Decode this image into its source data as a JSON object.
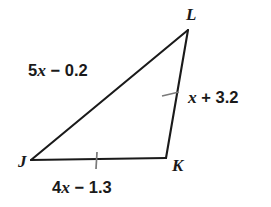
{
  "figure": {
    "kind": "triangle-diagram",
    "shape_name": "triangle JKL",
    "background_color": "#ffffff",
    "stroke_color": "#1a1a1a",
    "tick_color": "#6b6b6b",
    "width": 271,
    "height": 207
  },
  "vertices": [
    {
      "id": "L",
      "label": "L",
      "x": 188,
      "y": 30
    },
    {
      "id": "J",
      "label": "J",
      "x": 31,
      "y": 160
    },
    {
      "id": "K",
      "label": "K",
      "x": 166,
      "y": 158
    }
  ],
  "sides": [
    {
      "id": "JL",
      "from": "J",
      "to": "L",
      "label": "5x − 0.2",
      "label_parts": {
        "coefficient": "5",
        "variable": "x",
        "operator": "−",
        "constant": "0.2"
      },
      "tick_marks": 0
    },
    {
      "id": "LK",
      "from": "L",
      "to": "K",
      "label": "x + 3.2",
      "label_parts": {
        "coefficient": "",
        "variable": "x",
        "operator": "+",
        "constant": "3.2"
      },
      "tick_marks": 1
    },
    {
      "id": "JK",
      "from": "J",
      "to": "K",
      "label": "4x − 1.3",
      "label_parts": {
        "coefficient": "4",
        "variable": "x",
        "operator": "−",
        "constant": "1.3"
      },
      "tick_marks": 1
    }
  ],
  "labels": {
    "vertex_L": "L",
    "vertex_J": "J",
    "vertex_K": "K",
    "side_JL_coefficient": "5",
    "side_JL_variable": "x",
    "side_JL_tail": " − 0.2",
    "side_LK_variable": "x",
    "side_LK_tail": " + 3.2",
    "side_JK_coefficient": "4",
    "side_JK_variable": "x",
    "side_JK_tail": " − 1.3"
  }
}
